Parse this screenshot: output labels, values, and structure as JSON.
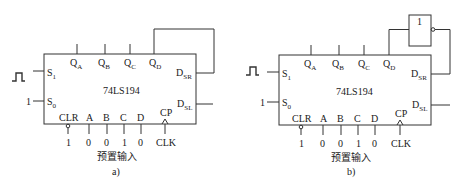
{
  "diagrams": [
    {
      "id": "a",
      "caption": "a)",
      "chip": "74LS194",
      "outputs": [
        {
          "main": "Q",
          "sub": "A"
        },
        {
          "main": "Q",
          "sub": "B"
        },
        {
          "main": "Q",
          "sub": "C"
        },
        {
          "main": "Q",
          "sub": "D"
        }
      ],
      "left_inputs": [
        {
          "main": "S",
          "sub": "1",
          "signal": "pulse"
        },
        {
          "main": "S",
          "sub": "0",
          "signal": "1"
        }
      ],
      "right_inputs": [
        {
          "main": "D",
          "sub": "SR"
        },
        {
          "main": "D",
          "sub": "SL"
        }
      ],
      "bottom_pins": [
        "CLR",
        "A",
        "B",
        "C",
        "D",
        "CP"
      ],
      "bottom_values": [
        "1",
        "0",
        "0",
        "1",
        "0",
        "CLK"
      ],
      "preset_label": "预置输入",
      "feedback": "QD → DSR (direct)"
    },
    {
      "id": "b",
      "caption": "b)",
      "chip": "74LS194",
      "outputs": [
        {
          "main": "Q",
          "sub": "A"
        },
        {
          "main": "Q",
          "sub": "B"
        },
        {
          "main": "Q",
          "sub": "C"
        },
        {
          "main": "Q",
          "sub": "D"
        }
      ],
      "left_inputs": [
        {
          "main": "S",
          "sub": "1",
          "signal": "pulse"
        },
        {
          "main": "S",
          "sub": "0",
          "signal": "1"
        }
      ],
      "right_inputs": [
        {
          "main": "D",
          "sub": "SR"
        },
        {
          "main": "D",
          "sub": "SL"
        }
      ],
      "bottom_pins": [
        "CLR",
        "A",
        "B",
        "C",
        "D",
        "CP"
      ],
      "bottom_values": [
        "1",
        "0",
        "0",
        "1",
        "0",
        "CLK"
      ],
      "preset_label": "预置输入",
      "inverter_label": "1",
      "feedback": "QD → NOT → DSR"
    }
  ]
}
